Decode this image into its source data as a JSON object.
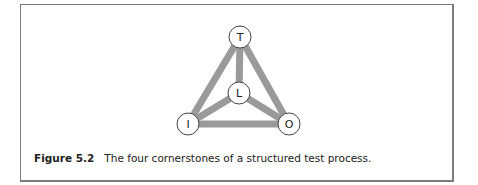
{
  "diagram": {
    "nodes": [
      {
        "id": "T",
        "label": "T",
        "x": 240,
        "y": 37
      },
      {
        "id": "L",
        "label": "L",
        "x": 239,
        "y": 93
      },
      {
        "id": "I",
        "label": "I",
        "x": 188,
        "y": 124
      },
      {
        "id": "O",
        "label": "O",
        "x": 289,
        "y": 124
      }
    ],
    "edges": [
      [
        "T",
        "I"
      ],
      [
        "T",
        "O"
      ],
      [
        "T",
        "L"
      ],
      [
        "L",
        "I"
      ],
      [
        "L",
        "O"
      ],
      [
        "I",
        "O"
      ]
    ],
    "colors": {
      "edge": "#9a9a9a",
      "node_fill": "#ffffff",
      "node_stroke": "#444444",
      "border": "#7a7a7a"
    }
  },
  "caption": {
    "label": "Figure 5.2",
    "text": "The four cornerstones of a structured test process."
  }
}
